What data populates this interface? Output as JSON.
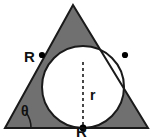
{
  "figure": {
    "credit": "Gráficos: CDAE",
    "colors": {
      "background": "#ffffff",
      "shaded_region": "#707070",
      "shaded_region_dark": "#5f5f5f",
      "circle_fill": "#ffffff",
      "stroke": "#1a1a1a",
      "dashed_line": "#1a1a1a",
      "point_marker": "#000000",
      "credit_text": "#555555",
      "label_text": "#111111"
    },
    "labels": {
      "side_R_left": "R",
      "side_R_bottom": "R",
      "radius_r": "r",
      "angle_theta": "θ"
    },
    "geometry": {
      "triangle_vertices": [
        {
          "name": "apex",
          "x": 73,
          "y": 5
        },
        {
          "name": "bottom-left",
          "x": 5,
          "y": 128
        },
        {
          "name": "bottom-right",
          "x": 148,
          "y": 128
        }
      ],
      "circle": {
        "cx": 83,
        "cy": 87,
        "r": 41
      },
      "tangent_points": [
        {
          "name": "left-tangent",
          "x": 42,
          "y": 55
        },
        {
          "name": "right-tangent",
          "x": 125,
          "y": 55
        },
        {
          "name": "bottom-tangent",
          "x": 83,
          "y": 128
        }
      ],
      "radius_line": {
        "x1": 83,
        "y1": 62,
        "x2": 83,
        "y2": 128,
        "style": "dashed"
      },
      "angle_arc": {
        "vertex_x": 5,
        "vertex_y": 128,
        "radius": 26
      }
    }
  }
}
